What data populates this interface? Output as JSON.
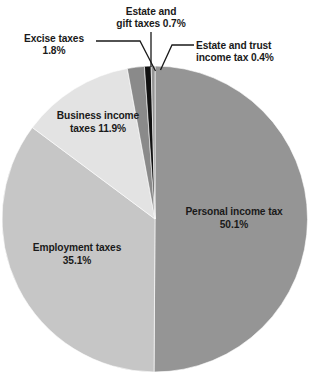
{
  "chart_data": {
    "type": "pie",
    "title": "",
    "subtitle": "",
    "xlabel": "",
    "ylabel": "",
    "legend_position": "none",
    "grid": false,
    "units": "percent",
    "categories": [
      "Personal income tax",
      "Employment taxes",
      "Business income taxes",
      "Excise taxes",
      "Estate and gift taxes",
      "Estate and trust income tax"
    ],
    "values": [
      50.1,
      35.1,
      11.9,
      1.8,
      0.7,
      0.4
    ],
    "slices": [
      {
        "name": "Personal income tax",
        "value": 50.1,
        "label": "Personal income tax\n50.1%",
        "color": "#959595",
        "label_style": "inline"
      },
      {
        "name": "Employment taxes",
        "value": 35.1,
        "label": "Employment taxes\n35.1%",
        "color": "#c6c6c6",
        "label_style": "inline"
      },
      {
        "name": "Business income taxes",
        "value": 11.9,
        "label": "Business income\ntaxes 11.9%",
        "color": "#e3e3e3",
        "label_style": "inline"
      },
      {
        "name": "Excise taxes",
        "value": 1.8,
        "label": "Excise taxes\n1.8%",
        "color": "#8a8a8a",
        "label_style": "callout"
      },
      {
        "name": "Estate and gift taxes",
        "value": 0.7,
        "label": "Estate and\ngift taxes 0.7%",
        "color": "#111111",
        "label_style": "callout"
      },
      {
        "name": "Estate and trust income tax",
        "value": 0.4,
        "label": "Estate and trust\nincome tax 0.4%",
        "color": "#959595",
        "label_style": "callout"
      }
    ]
  },
  "labels": {
    "personal_income_tax": "Personal income tax\n50.1%",
    "employment_taxes": "Employment taxes\n35.1%",
    "business_income_taxes": "Business income\ntaxes 11.9%",
    "excise_taxes": "Excise taxes\n1.8%",
    "estate_and_gift_taxes": "Estate and\ngift taxes 0.7%",
    "estate_and_trust_income_tax": "Estate and trust\nincome tax 0.4%"
  },
  "colors": {
    "personal_income_tax": "#959595",
    "employment_taxes": "#c6c6c6",
    "business_income_taxes": "#e3e3e3",
    "excise_taxes": "#8a8a8a",
    "estate_and_gift_taxes": "#111111",
    "estate_and_trust_income_tax": "#959595",
    "leader_line": "#1a1a1a",
    "background": "#ffffff",
    "text": "#1a1a1a"
  },
  "geometry": {
    "center_x": 155,
    "center_y": 219,
    "radius": 153,
    "start_angle_deg": -90
  }
}
